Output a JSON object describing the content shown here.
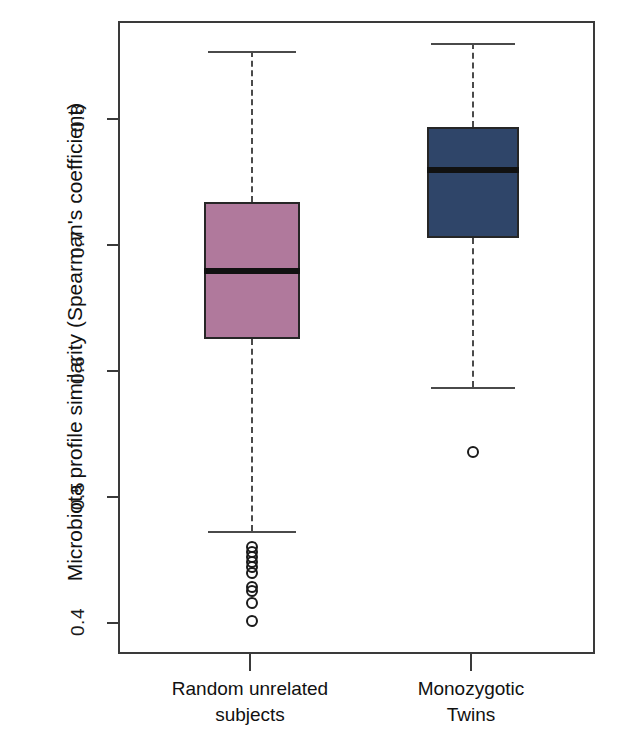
{
  "figure": {
    "type": "boxplot-figure",
    "background": "#ffffff"
  },
  "axes": {
    "y_title": "Microbiota profile similarity (Spearman's coefficient)",
    "y_ticks": [
      "0.4",
      "0.5",
      "0.6",
      "0.7",
      "0.8"
    ],
    "y_min": 0.375,
    "y_max": 0.878,
    "x_labels": [
      "Random unrelated\nsubjects",
      "Monozygotic\nTwins"
    ]
  },
  "colors": {
    "group1_fill": "#b0799c",
    "group2_fill": "#2f4569",
    "box_border": "#262626",
    "median_line": "#111111",
    "whisker": "#4a4a4a",
    "frame": "#3a3a3a"
  },
  "chart_data": {
    "type": "box",
    "title": "",
    "xlabel": "",
    "ylabel": "Microbiota profile similarity (Spearman's coefficient)",
    "ylim": [
      0.375,
      0.878
    ],
    "ytick_values": [
      0.4,
      0.5,
      0.6,
      0.7,
      0.8
    ],
    "grid": false,
    "legend": "none",
    "categories": [
      "Random unrelated subjects",
      "Monozygotic Twins"
    ],
    "series": [
      {
        "name": "Random unrelated subjects",
        "color": "#b0799c",
        "whisker_high": 0.856,
        "q3": 0.736,
        "median": 0.681,
        "q1": 0.627,
        "whisker_low": 0.474,
        "outliers": [
          0.462,
          0.458,
          0.454,
          0.45,
          0.446,
          0.441,
          0.43,
          0.427,
          0.417,
          0.403
        ]
      },
      {
        "name": "Monozygotic Twins",
        "color": "#2f4569",
        "whisker_high": 0.862,
        "q3": 0.795,
        "median": 0.761,
        "q1": 0.707,
        "whisker_low": 0.589,
        "outliers": [
          0.537
        ]
      }
    ]
  },
  "margin_marks": {
    "left_top": "",
    "left_bottom": ""
  }
}
